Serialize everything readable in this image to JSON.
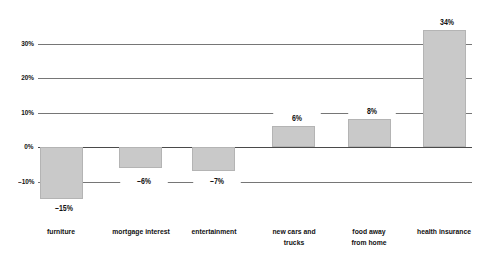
{
  "chart_data": {
    "type": "bar",
    "title": "",
    "subtitle": "",
    "xlabel": "",
    "ylabel": "",
    "categories": [
      "furniture",
      "mortgage interest",
      "entertainment",
      "new cars and\ntrucks",
      "food away\nfrom home",
      "health insurance"
    ],
    "values": [
      -15,
      -6,
      -7,
      6,
      8,
      34
    ],
    "value_labels": [
      "–15%",
      "–6%",
      "–7%",
      "6%",
      "8%",
      "34%"
    ],
    "ylim": [
      -18,
      36
    ],
    "yticks": [
      30,
      20,
      10,
      0,
      -10
    ],
    "ytick_labels": [
      "30%",
      "20%",
      "10%",
      "0%",
      "–10%"
    ],
    "grid": true,
    "legend": false,
    "bar_color": "#c9c9c9",
    "bar_border_color": "#b4b4b4",
    "gridline_color": "#767676",
    "axis_color": "#4a4a4a",
    "text_color": "#111111",
    "background": "#ffffff"
  }
}
